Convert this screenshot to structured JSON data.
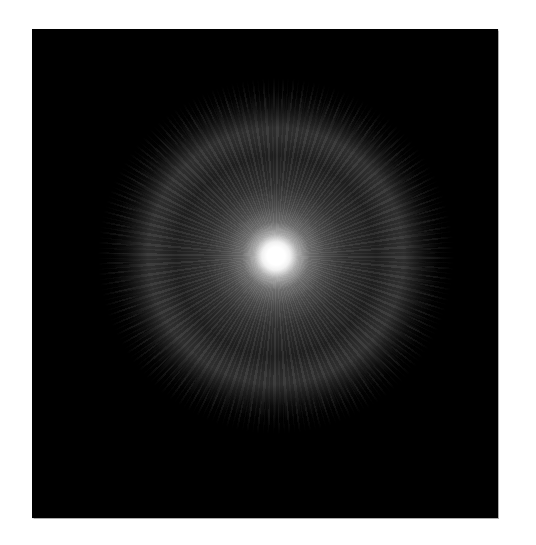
{
  "image": {
    "subject": "radial light burst",
    "description": "Bright white glowing point at center with radiating gray rays and a faint outer ring, on a black square background framed by white margins",
    "colors": {
      "page_background": "#ffffff",
      "frame_background": "#000000",
      "core": "#ffffff",
      "rays": "#8c8c8c",
      "ring": "#787878"
    }
  }
}
